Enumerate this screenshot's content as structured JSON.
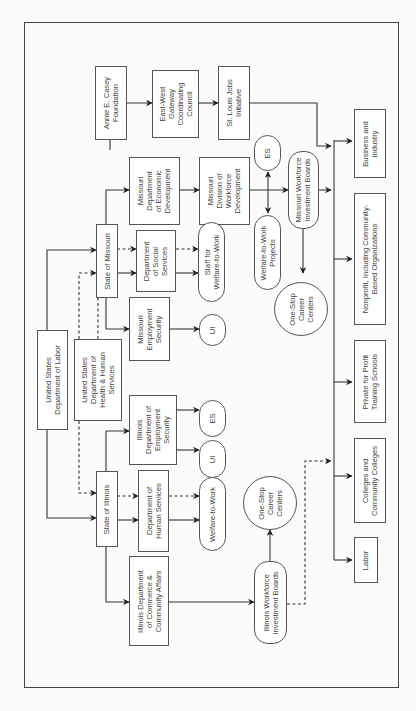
{
  "diagram": {
    "title": "",
    "orientation": "rotated-90-ccw",
    "nodes": {
      "annie_casey": "Annie E. Casey\nFoundation",
      "east_west": "East-West\nGateway\nCoordinating\nCouncil",
      "st_louis_jobs": "St. Louis Jobs\nInitiative",
      "mo_econ_dev": "Missouri\nDepartment\nof Economic\nDevelopment",
      "mo_workforce_dev": "Missouri\nDivision of\nWorkforce\nDevelopment",
      "mo_es": "ES",
      "mo_wib": "Missouri Workforce\nInvestment Boards",
      "mo_w2w_projects": "Welfare-to-Work\nProjects",
      "mo_onestop": "One-Stop\nCareer\nCenters",
      "mo_staff_w2w": "Staff for\nWelfare-to-Work",
      "mo_social_services": "Department\nof Social\nServices",
      "state_missouri": "State of Missouri",
      "mo_employment_security": "Missouri\nEmployment\nSecurity",
      "mo_ui": "UI",
      "us_labor": "United States\nDepartment of Labor",
      "us_hhs": "United States\nDepartment of\nHealth & Human\nServices",
      "il_employment_security": "Illinois\nDepartment of\nEmployment\nSecurity",
      "il_es": "ES",
      "il_ui": "UI",
      "state_illinois": "State of Illinois",
      "il_human_services": "Department of\nHuman Services",
      "il_w2w": "Welfare-to-Work",
      "il_commerce": "Illinois Department\nof Commerce &\nCommunity Affairs",
      "il_wib": "Illinois Workforce\nInvestment Boards",
      "il_onestop": "One-Stop\nCareer\nCenters",
      "labor": "Labor",
      "colleges": "Colleges and\nCommunity Colleges",
      "private_schools": "Private for Profit\nTraining Schools",
      "nonprofit": "Nonprofit, Including Community-\nBased Organizations",
      "business": "Business and\nIndustry"
    },
    "edges": [
      {
        "from": "annie_casey",
        "to": "east_west",
        "style": "solid"
      },
      {
        "from": "east_west",
        "to": "st_louis_jobs",
        "style": "solid"
      },
      {
        "from": "st_louis_jobs",
        "to": "business",
        "style": "solid"
      },
      {
        "from": "us_labor",
        "to": "state_missouri",
        "style": "solid"
      },
      {
        "from": "us_labor",
        "to": "state_illinois",
        "style": "solid"
      },
      {
        "from": "us_hhs",
        "to": "state_missouri",
        "style": "dashed"
      },
      {
        "from": "us_hhs",
        "to": "state_illinois",
        "style": "dashed"
      },
      {
        "from": "state_missouri",
        "to": "mo_econ_dev",
        "style": "solid"
      },
      {
        "from": "state_missouri",
        "to": "mo_social_services",
        "style": "solid"
      },
      {
        "from": "state_missouri",
        "to": "mo_social_services",
        "style": "dashed"
      },
      {
        "from": "state_missouri",
        "to": "mo_employment_security",
        "style": "solid"
      },
      {
        "from": "mo_econ_dev",
        "to": "mo_workforce_dev",
        "style": "solid"
      },
      {
        "from": "mo_workforce_dev",
        "to": "mo_wib",
        "style": "solid"
      },
      {
        "from": "mo_workforce_dev",
        "to": "mo_es",
        "style": "solid"
      },
      {
        "from": "mo_workforce_dev",
        "to": "mo_w2w_projects",
        "style": "solid"
      },
      {
        "from": "mo_social_services",
        "to": "mo_staff_w2w",
        "style": "solid"
      },
      {
        "from": "mo_social_services",
        "to": "mo_staff_w2w",
        "style": "dashed"
      },
      {
        "from": "mo_employment_security",
        "to": "mo_ui",
        "style": "solid"
      },
      {
        "from": "mo_wib",
        "to": "mo_onestop",
        "style": "solid"
      },
      {
        "from": "mo_wib",
        "to": "providers",
        "style": "solid"
      },
      {
        "from": "state_illinois",
        "to": "il_employment_security",
        "style": "solid"
      },
      {
        "from": "state_illinois",
        "to": "il_human_services",
        "style": "solid"
      },
      {
        "from": "state_illinois",
        "to": "il_human_services",
        "style": "dashed"
      },
      {
        "from": "state_illinois",
        "to": "il_commerce",
        "style": "solid"
      },
      {
        "from": "il_employment_security",
        "to": "il_es",
        "style": "solid"
      },
      {
        "from": "il_employment_security",
        "to": "il_ui",
        "style": "solid"
      },
      {
        "from": "il_human_services",
        "to": "il_w2w",
        "style": "solid"
      },
      {
        "from": "il_human_services",
        "to": "il_w2w",
        "style": "dashed"
      },
      {
        "from": "il_commerce",
        "to": "il_wib",
        "style": "solid"
      },
      {
        "from": "il_wib",
        "to": "il_onestop",
        "style": "solid"
      },
      {
        "from": "il_wib",
        "to": "providers",
        "style": "dashed"
      },
      {
        "from": "providers",
        "to": "business",
        "style": "solid"
      },
      {
        "from": "providers",
        "to": "nonprofit",
        "style": "solid"
      },
      {
        "from": "providers",
        "to": "private_schools",
        "style": "solid"
      },
      {
        "from": "providers",
        "to": "colleges",
        "style": "solid"
      },
      {
        "from": "providers",
        "to": "labor",
        "style": "solid"
      }
    ],
    "colors": {
      "line": "#333333",
      "box_border": "#555555",
      "text": "#444444",
      "background": "#fbfbfb"
    }
  }
}
